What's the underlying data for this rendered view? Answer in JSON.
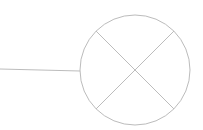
{
  "diagram": {
    "type": "electrical-schematic",
    "symbol": "lamp",
    "stroke_color": "#bcbcbc",
    "stroke_width": 1,
    "background": "#ffffff",
    "lamp": {
      "cx": 135,
      "cy": 70,
      "r": 55,
      "cross": [
        {
          "x1": 96,
          "y1": 31,
          "x2": 174,
          "y2": 109
        },
        {
          "x1": 174,
          "y1": 31,
          "x2": 96,
          "y2": 109
        }
      ]
    },
    "wire": {
      "x1": 0,
      "y1": 69,
      "x2": 80,
      "y2": 71
    }
  }
}
